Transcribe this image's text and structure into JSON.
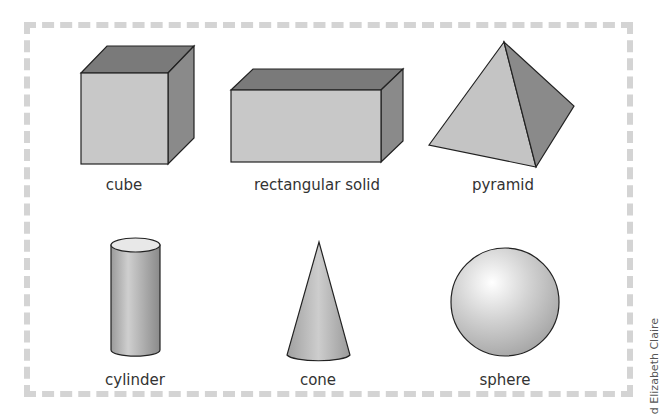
{
  "shapes": {
    "cube": "cube",
    "rectangular_solid": "rectangular solid",
    "pyramid": "pyramid",
    "cylinder": "cylinder",
    "cone": "cone",
    "sphere": "sphere"
  },
  "credit": "d Elizabeth Claire",
  "colors": {
    "front": "#c8c8c8",
    "top": "#7a7a7a",
    "side": "#8a8a8a",
    "outline": "#222222",
    "border": "#d4d4d4"
  }
}
